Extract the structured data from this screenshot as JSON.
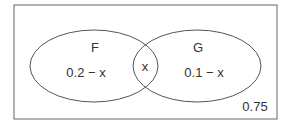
{
  "diagram": {
    "type": "venn",
    "sets": [
      {
        "name": "F",
        "label": "F",
        "region_value": "0.2 − x"
      },
      {
        "name": "G",
        "label": "G",
        "region_value": "0.1 − x"
      }
    ],
    "intersection_value": "x",
    "outside_value": "0.75",
    "colors": {
      "stroke": "#555555",
      "text": "#333333",
      "background": "#ffffff"
    }
  }
}
